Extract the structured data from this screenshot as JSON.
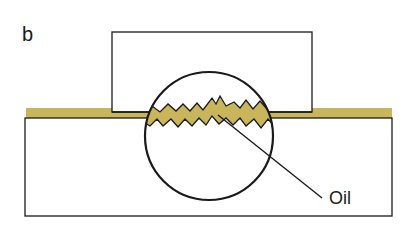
{
  "figure": {
    "panel_label": "b",
    "callout_label": "Oil",
    "colors": {
      "oil": "#c9b65a",
      "stroke": "#1a1a1a",
      "background": "#ffffff"
    }
  }
}
